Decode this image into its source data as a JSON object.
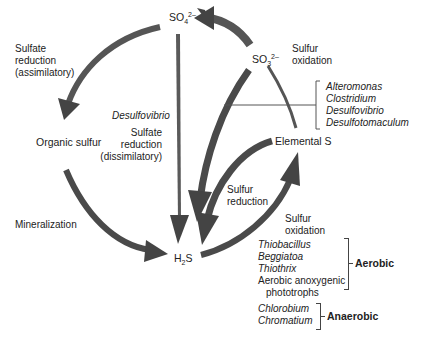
{
  "nodes": {
    "sulfate": {
      "base": "SO",
      "sub": "4",
      "sup": "2–"
    },
    "sulfite": {
      "base": "SO",
      "sub": "3",
      "sup": "2–"
    },
    "organic_sulfur": "Organic sulfur",
    "elemental_s": "Elemental S",
    "h2s": {
      "pre": "H",
      "sub": "2",
      "post": "S"
    }
  },
  "processes": {
    "assimilatory": [
      "Sulfate",
      "reduction",
      "(assimilatory)"
    ],
    "sulfur_oxidation_top": [
      "Sulfur",
      "oxidation"
    ],
    "dissimilatory_organism": "Desulfovibrio",
    "dissimilatory": [
      "Sulfate",
      "reduction",
      "(dissimilatory)"
    ],
    "mineralization": "Mineralization",
    "sulfur_reduction": [
      "Sulfur",
      "reduction"
    ],
    "sulfur_oxidation_bottom": [
      "Sulfur",
      "oxidation"
    ]
  },
  "organisms": {
    "sulfur_reducers": [
      "Alteromonas",
      "Clostridium",
      "Desulfovibrio",
      "Desulfotomaculum"
    ],
    "aerobic": {
      "label": "Aerobic",
      "italic": [
        "Thiobacillus",
        "Beggiatoa",
        "Thiothrix"
      ],
      "plain": [
        "Aerobic anoxygenic",
        "phototrophs"
      ]
    },
    "anaerobic": {
      "label": "Anaerobic",
      "italic": [
        "Chlorobium",
        "Chromatium"
      ]
    }
  },
  "colors": {
    "arrow": "#4a4a4a",
    "arrow_light": "#8a8a8a",
    "line": "#555555",
    "text": "#222222"
  }
}
